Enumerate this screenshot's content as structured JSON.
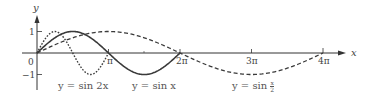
{
  "chart_data": {
    "type": "line",
    "title": "",
    "xlabel": "x",
    "ylabel": "y",
    "xlim": [
      0,
      12.566
    ],
    "ylim": [
      -1,
      1
    ],
    "grid": false,
    "legend": "inline labels below curves",
    "x_ticks": [
      {
        "value": 3.1416,
        "label": "π"
      },
      {
        "value": 6.2832,
        "label": "2π"
      },
      {
        "value": 9.4248,
        "label": "3π"
      },
      {
        "value": 12.5664,
        "label": "4π"
      }
    ],
    "y_ticks": [
      {
        "value": 1,
        "label": "1"
      },
      {
        "value": -1,
        "label": "−1"
      }
    ],
    "origin_label": "0",
    "series": [
      {
        "name": "y = sin 2x",
        "function": "sin(2x)",
        "domain": [
          0,
          3.1416
        ],
        "style": "dotted",
        "label_x": 0.9
      },
      {
        "name": "y = sin x",
        "function": "sin(x)",
        "domain": [
          0,
          6.2832
        ],
        "style": "solid",
        "label_x": 4.7
      },
      {
        "name": "y = sin x/2",
        "function": "sin(x/2)",
        "domain": [
          0,
          12.5664
        ],
        "style": "dashed",
        "label_x": 9.6
      }
    ]
  },
  "labels": {
    "y_axis": "y",
    "x_axis": "x",
    "origin": "0",
    "y_one": "1",
    "y_neg_one": "−1",
    "tick_pi": "π",
    "tick_2pi": "2π",
    "tick_3pi": "3π",
    "tick_4pi": "4π",
    "curve_sin2x": "y = sin 2x",
    "curve_sinx": "y = sin x",
    "curve_sinhalf_prefix": "y = sin",
    "curve_sinhalf_num": "x",
    "curve_sinhalf_den": "2"
  },
  "colors": {
    "axis": "#333333",
    "curve": "#3a3a3a",
    "text": "#444444"
  }
}
